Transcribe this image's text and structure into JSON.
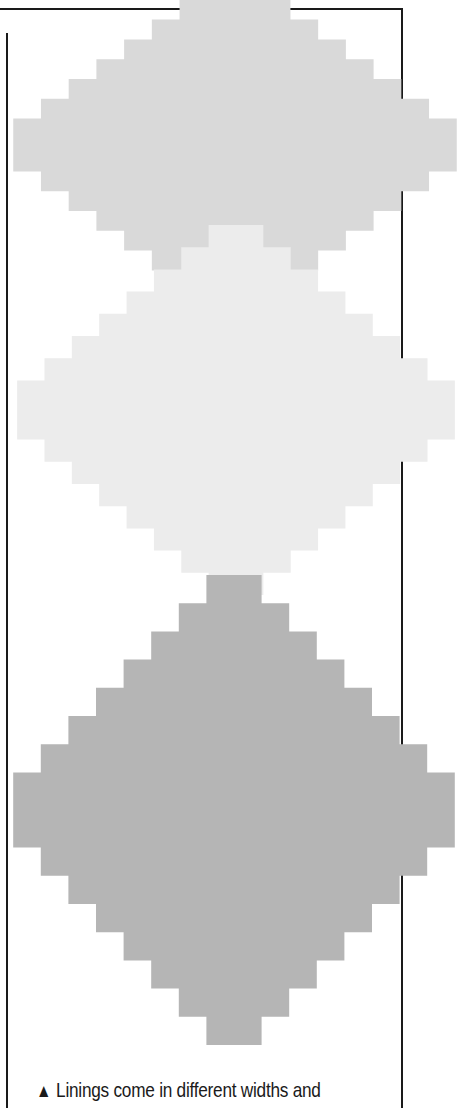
{
  "page": {
    "swatches": [
      {
        "name": "lining-swatch-1",
        "color": "#d9d9d9"
      },
      {
        "name": "lining-swatch-2",
        "color": "#ebebeb"
      },
      {
        "name": "lining-swatch-3",
        "color": "#b4b4b4"
      }
    ],
    "caption": {
      "marker": "▲",
      "text": "Linings come in different widths and"
    }
  }
}
